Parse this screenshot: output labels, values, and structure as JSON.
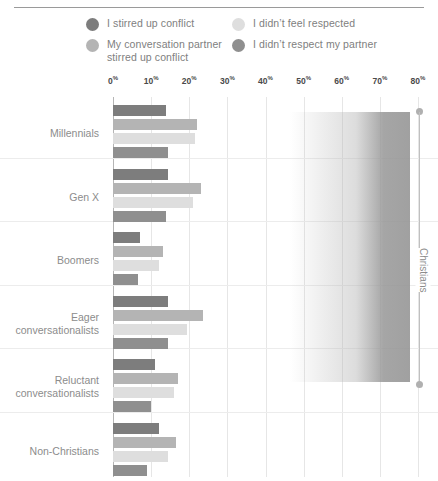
{
  "legend": {
    "items": [
      {
        "label": "I stirred up conflict",
        "color": "#7d7d7d",
        "column": "left"
      },
      {
        "label": "My conversation partner\nstirred up conflict",
        "color": "#b4b4b4",
        "column": "left"
      },
      {
        "label": "I didn’t feel respected",
        "color": "#dedede",
        "column": "right"
      },
      {
        "label": "I didn’t respect my partner",
        "color": "#8f8f8f",
        "column": "right"
      }
    ]
  },
  "annotation": {
    "bracket_label": "Christians"
  },
  "chart_data": {
    "type": "bar",
    "orientation": "horizontal",
    "title": "",
    "xlabel": "",
    "ylabel": "",
    "xlim": [
      0,
      80
    ],
    "xticks": [
      0,
      10,
      20,
      30,
      40,
      50,
      60,
      70,
      80
    ],
    "xtick_labels": [
      "0%",
      "10%",
      "20%",
      "30%",
      "40%",
      "50%",
      "60%",
      "70%",
      "80%"
    ],
    "tick_suffix": "%",
    "grid": true,
    "legend_position": "top",
    "categories": [
      "Millennials",
      "Gen X",
      "Boomers",
      "Eager\nconversationalists",
      "Reluctant\nconversationalists",
      "Non-Christians"
    ],
    "series": [
      {
        "name": "I stirred up conflict",
        "color": "#7d7d7d",
        "values": [
          14,
          14.5,
          7,
          14.5,
          11,
          12
        ]
      },
      {
        "name": "My conversation partner stirred up conflict",
        "color": "#b4b4b4",
        "values": [
          22,
          23,
          13,
          23.5,
          17,
          16.5
        ]
      },
      {
        "name": "I didn’t feel respected",
        "color": "#dedede",
        "values": [
          21.5,
          21,
          12,
          19.5,
          16,
          14.5
        ]
      },
      {
        "name": "I didn’t respect my partner",
        "color": "#8f8f8f",
        "values": [
          14.5,
          14,
          6.5,
          14.5,
          10,
          9
        ]
      }
    ],
    "group_bracket": {
      "label": "Christians",
      "covers": [
        "Millennials",
        "Gen X",
        "Boomers",
        "Eager\nconversationalists",
        "Reluctant\nconversationalists"
      ]
    }
  }
}
